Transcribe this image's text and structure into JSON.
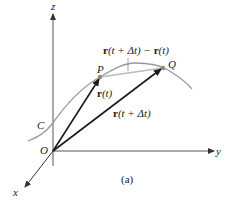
{
  "figure": {
    "caption": "(a)",
    "axes": {
      "z_label": "z",
      "y_label": "y",
      "x_label": "x",
      "origin_label": "O"
    },
    "curve": {
      "label": "C",
      "color": "#9a9a9a"
    },
    "points": {
      "P": "P",
      "Q": "Q"
    },
    "vectors": {
      "r_t": {
        "bold": "r",
        "rest": "(t)"
      },
      "r_t_dt": {
        "bold": "r",
        "rest": "(t + Δt)"
      },
      "difference": {
        "bold1": "r",
        "rest1": "(t + Δt) − ",
        "bold2": "r",
        "rest2": "(t)"
      }
    },
    "colors": {
      "axis": "#555555",
      "vector": "#1a1a1a",
      "curve": "#9a9a9a",
      "secant": "#bbbbbb",
      "point": "#8a8a8a"
    }
  }
}
